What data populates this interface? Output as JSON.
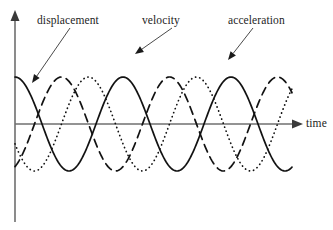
{
  "figure": {
    "width": 333,
    "height": 230,
    "background": "#ffffff",
    "ink_color": "#121212",
    "axis_color": "#6f6f6f"
  },
  "labels": {
    "displacement": "displacement",
    "velocity": "velocity",
    "acceleration": "acceleration",
    "time_axis": "time"
  },
  "chart_data": {
    "type": "line",
    "title": "",
    "subtitle": "",
    "xlabel": "time",
    "ylabel": "",
    "grid": false,
    "legend": "annotated-callouts",
    "xlim": [
      0,
      2.64
    ],
    "ylim": [
      -1.15,
      1.15
    ],
    "axes": {
      "x_axis_origin_px": 15,
      "y_axis_zero_px": 124,
      "x_axis_end_px": 300,
      "y_axis_top_px": 12,
      "y_axis_bottom_px": 222,
      "x_axis_arrow": true,
      "y_axis_arrow": true,
      "ticks": [],
      "tick_labels": []
    },
    "wave": {
      "period_px": 108,
      "amplitude_px": 47,
      "cycles_shown": 2.6
    },
    "series": [
      {
        "name": "displacement",
        "style": "solid",
        "form": "cos",
        "phase_deg": 0,
        "amplitude": 1.0,
        "x": [
          0.0,
          0.13,
          0.25,
          0.38,
          0.5,
          0.63,
          0.75,
          0.88,
          1.0,
          1.13,
          1.25,
          1.38,
          1.5,
          1.63,
          1.75,
          1.88,
          2.0,
          2.13,
          2.25,
          2.38,
          2.5,
          2.64
        ],
        "values": [
          1.0,
          0.71,
          0.0,
          -0.71,
          -1.0,
          -0.71,
          0.0,
          0.71,
          1.0,
          0.71,
          0.0,
          -0.71,
          -1.0,
          -0.71,
          0.0,
          0.71,
          1.0,
          0.71,
          0.0,
          -0.71,
          -1.0,
          -0.8
        ]
      },
      {
        "name": "velocity",
        "style": "dotted",
        "form": "-sin shifted",
        "phase_deg": 115,
        "amplitude": 1.0,
        "x": [
          0.0,
          0.13,
          0.25,
          0.38,
          0.5,
          0.63,
          0.75,
          0.88,
          1.0,
          1.13,
          1.25,
          1.38,
          1.5,
          1.63,
          1.75,
          1.88,
          2.0,
          2.13,
          2.25,
          2.38,
          2.5,
          2.64
        ],
        "values": [
          -0.96,
          -0.55,
          0.08,
          0.67,
          0.99,
          0.89,
          0.42,
          -0.25,
          -0.8,
          -1.0,
          -0.76,
          -0.2,
          0.45,
          0.91,
          1.0,
          0.7,
          0.12,
          -0.52,
          -0.94,
          -0.99,
          -0.63,
          -0.05
        ]
      },
      {
        "name": "acceleration",
        "style": "dashed",
        "form": "-cos shifted",
        "phase_deg": 205,
        "amplitude": 1.0,
        "x": [
          0.0,
          0.13,
          0.25,
          0.38,
          0.5,
          0.63,
          0.75,
          0.88,
          1.0,
          1.13,
          1.25,
          1.38,
          1.5,
          1.63,
          1.75,
          1.88,
          2.0,
          2.13,
          2.25,
          2.38,
          2.5,
          2.64
        ],
        "values": [
          0.05,
          -0.62,
          -0.98,
          -0.85,
          -0.28,
          0.44,
          0.93,
          0.97,
          0.54,
          -0.16,
          -0.76,
          -1.0,
          -0.72,
          -0.08,
          0.6,
          0.99,
          0.87,
          0.31,
          -0.41,
          -0.92,
          -0.98,
          -0.58
        ]
      }
    ],
    "callouts": [
      {
        "label": "displacement",
        "label_pos_px": [
          37,
          14
        ],
        "line_from_px": [
          70,
          28
        ],
        "line_to_px": [
          32,
          83
        ],
        "target_series": "displacement"
      },
      {
        "label": "velocity",
        "label_pos_px": [
          142,
          14
        ],
        "line_from_px": [
          172,
          28
        ],
        "line_to_px": [
          135,
          54
        ],
        "target_series": "velocity"
      },
      {
        "label": "acceleration",
        "label_pos_px": [
          228,
          14
        ],
        "line_from_px": [
          253,
          28
        ],
        "line_to_px": [
          228,
          60
        ],
        "target_series": "acceleration"
      }
    ]
  }
}
